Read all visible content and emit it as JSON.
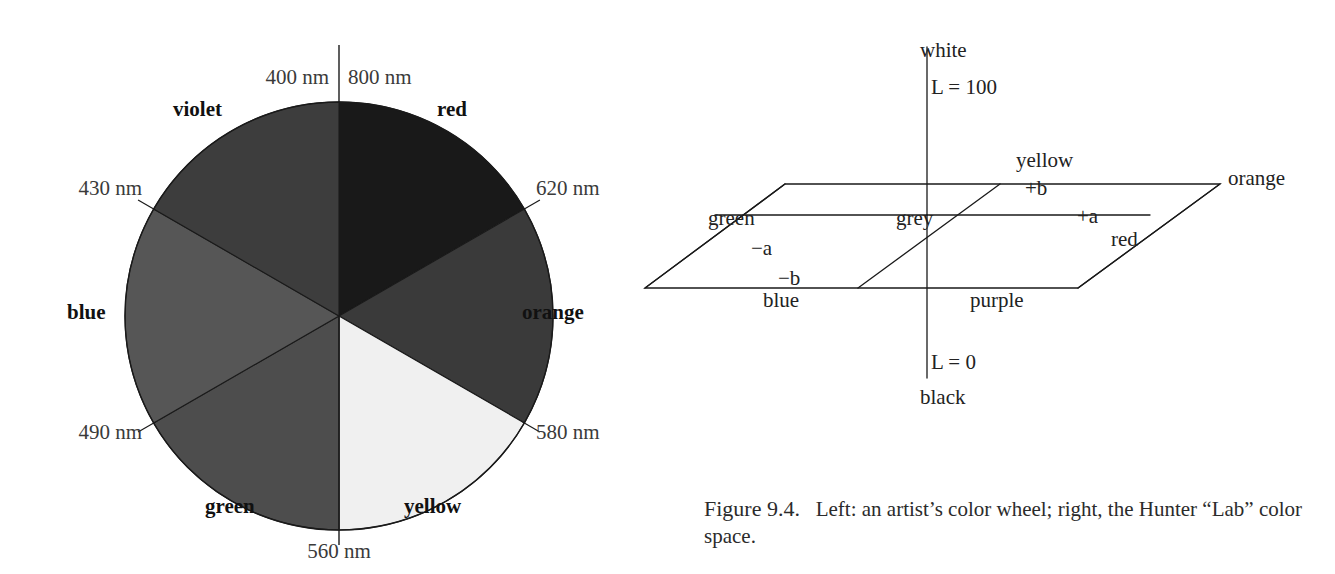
{
  "figure": {
    "caption_number": "Figure 9.4.",
    "caption_text": "Left: an artist’s color wheel; right, the Hunter “Lab” color space."
  },
  "color_wheel": {
    "title": "artist’s color wheel",
    "center": {
      "x": 339,
      "y": 316
    },
    "radius": 214,
    "segments": [
      {
        "name": "red",
        "label": "red",
        "start_deg": 0,
        "end_deg": 60,
        "fill": "#191919",
        "label_pos": {
          "x": 437,
          "y": 97
        }
      },
      {
        "name": "orange",
        "label": "orange",
        "start_deg": 60,
        "end_deg": 120,
        "fill": "#3a3a3a",
        "label_pos": {
          "x": 522,
          "y": 300
        }
      },
      {
        "name": "yellow",
        "label": "yellow",
        "start_deg": 120,
        "end_deg": 180,
        "fill": "#f0f0f0",
        "label_pos": {
          "x": 404,
          "y": 494
        }
      },
      {
        "name": "green",
        "label": "green",
        "start_deg": 180,
        "end_deg": 240,
        "fill": "#4d4d4d",
        "label_pos": {
          "x": 205,
          "y": 494
        }
      },
      {
        "name": "blue",
        "label": "blue",
        "start_deg": 240,
        "end_deg": 300,
        "fill": "#565656",
        "label_pos": {
          "x": 67,
          "y": 300
        }
      },
      {
        "name": "violet",
        "label": "violet",
        "start_deg": 300,
        "end_deg": 360,
        "fill": "#3d3d3d",
        "label_pos": {
          "x": 173,
          "y": 97
        }
      }
    ],
    "wavelength_labels": [
      {
        "name": "wavelength-800",
        "text": "800 nm",
        "x": 348,
        "y": 65,
        "align": "left"
      },
      {
        "name": "wavelength-400",
        "text": "400 nm",
        "x": 329,
        "y": 65,
        "align": "right"
      },
      {
        "name": "wavelength-620",
        "text": "620 nm",
        "x": 536,
        "y": 176,
        "align": "left"
      },
      {
        "name": "wavelength-580",
        "text": "580 nm",
        "x": 536,
        "y": 420,
        "align": "left"
      },
      {
        "name": "wavelength-560",
        "text": "560 nm",
        "x": 339,
        "y": 539,
        "align": "center"
      },
      {
        "name": "wavelength-490",
        "text": "490 nm",
        "x": 142,
        "y": 420,
        "align": "right"
      },
      {
        "name": "wavelength-430",
        "text": "430 nm",
        "x": 142,
        "y": 176,
        "align": "right"
      }
    ]
  },
  "lab_space": {
    "title": "Hunter “Lab” color space",
    "axis_labels": [
      {
        "name": "white",
        "text": "white",
        "x": 280,
        "y": 38
      },
      {
        "name": "l-100",
        "text": "L = 100",
        "x": 291,
        "y": 75
      },
      {
        "name": "l-0",
        "text": "L = 0",
        "x": 291,
        "y": 350
      },
      {
        "name": "black",
        "text": "black",
        "x": 280,
        "y": 385
      }
    ],
    "plane_labels": [
      {
        "name": "yellow",
        "text": "yellow",
        "x": 376,
        "y": 148
      },
      {
        "name": "plus-b",
        "text": "+b",
        "x": 385,
        "y": 176
      },
      {
        "name": "orange",
        "text": "orange",
        "x": 588,
        "y": 166
      },
      {
        "name": "green",
        "text": "green",
        "x": 68,
        "y": 206
      },
      {
        "name": "grey",
        "text": "grey",
        "x": 256,
        "y": 206
      },
      {
        "name": "plus-a",
        "text": "+a",
        "x": 437,
        "y": 204
      },
      {
        "name": "red",
        "text": "red",
        "x": 471,
        "y": 227
      },
      {
        "name": "minus-a",
        "text": "−a",
        "x": 111,
        "y": 236
      },
      {
        "name": "minus-b",
        "text": "−b",
        "x": 138,
        "y": 266
      },
      {
        "name": "blue",
        "text": "blue",
        "x": 123,
        "y": 288
      },
      {
        "name": "purple",
        "text": "purple",
        "x": 330,
        "y": 288
      }
    ]
  },
  "colors": {
    "stroke": "#1a1a1a",
    "background": "#ffffff",
    "text": "#1a1a1a",
    "label_grey": "#3a3a3a"
  }
}
